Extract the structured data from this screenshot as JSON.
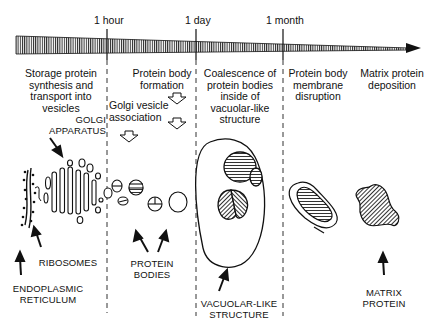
{
  "timeline": {
    "ticks": [
      {
        "label": "1 hour",
        "x": 107
      },
      {
        "label": "1 day",
        "x": 196
      },
      {
        "label": "1 month",
        "x": 283
      }
    ]
  },
  "stages": [
    {
      "label": "Storage protein\nsynthesis and\ntransport into\nvesicles"
    },
    {
      "label": "Protein body\nformation"
    },
    {
      "label": "Golgi vesicle\nassociation"
    },
    {
      "label": "Coalescence of\nprotein bodies\ninside of\nvacuolar-like\nstructure"
    },
    {
      "label": "Protein body\nmembrane\ndisruption"
    },
    {
      "label": "Matrix protein\ndeposition"
    }
  ],
  "structures": {
    "golgi": "GOLGI\nAPPARATUS",
    "ribosomes": "RIBOSOMES",
    "er": "ENDOPLASMIC\nRETICULUM",
    "protein_bodies": "PROTEIN\nBODIES",
    "vacuole": "VACUOLAR-LIKE\nSTRUCTURE",
    "matrix": "MATRIX\nPROTEIN"
  },
  "colors": {
    "ink": "#111111",
    "paper": "#ffffff"
  }
}
